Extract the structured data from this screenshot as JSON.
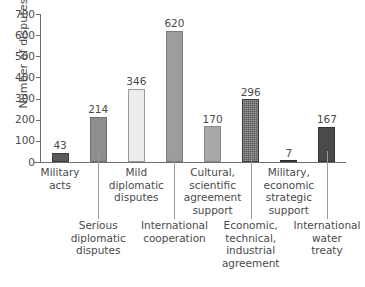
{
  "chart_data": {
    "type": "bar",
    "title": "",
    "xlabel": "",
    "ylabel": "Number of disputes",
    "ylim": [
      0,
      700
    ],
    "ytick_values": [
      700,
      600,
      500,
      400,
      300,
      200,
      100,
      0
    ],
    "ytick_labels": [
      "700",
      "600",
      "500",
      "400",
      "300",
      "200",
      "100",
      "0"
    ],
    "grid": false,
    "legend": "none",
    "categories": [
      "Military acts",
      "Serious diplomatic disputes",
      "Mild diplomatic disputes",
      "International cooperation",
      "Cultural, scientific agreement support",
      "Economic, technical, industrial agreement",
      "Military, economic strategic support",
      "International water treaty"
    ],
    "values": [
      43,
      214,
      346,
      620,
      170,
      296,
      7,
      167
    ],
    "value_labels": [
      "43",
      "214",
      "346",
      "620",
      "170",
      "296",
      "7",
      "167"
    ],
    "bar_colors": [
      "#595959",
      "#8e8e8e",
      "#ededed",
      "#9d9d9d",
      "#a8a8a8",
      "#555555",
      "#3f3f3f",
      "#4a4a4a"
    ],
    "bar_edge_colors": [
      "#3d3d3d",
      "#6f6f6f",
      "#9a9a9a",
      "#7a7a7a",
      "#8a8a8a",
      "#3a3a3a",
      "#2f2f2f",
      "#343434"
    ],
    "bar_textured": [
      false,
      false,
      false,
      false,
      false,
      true,
      false,
      false
    ]
  },
  "labels": {
    "row_top": [
      {
        "index": 0,
        "lines": [
          "Military",
          "acts"
        ]
      },
      {
        "index": 2,
        "lines": [
          "Mild",
          "diplomatic",
          "disputes"
        ]
      },
      {
        "index": 4,
        "lines": [
          "Cultural,",
          "scientific",
          "agreement",
          "support"
        ]
      },
      {
        "index": 6,
        "lines": [
          "Military,",
          "economic",
          "strategic",
          "support"
        ]
      }
    ],
    "row_bottom": [
      {
        "index": 1,
        "lines": [
          "Serious",
          "diplomatic",
          "disputes"
        ]
      },
      {
        "index": 3,
        "lines": [
          "International",
          "cooperation"
        ]
      },
      {
        "index": 5,
        "lines": [
          "Economic,",
          "technical,",
          "industrial",
          "agreement"
        ]
      },
      {
        "index": 7,
        "lines": [
          "International",
          "water",
          "treaty"
        ]
      }
    ]
  }
}
